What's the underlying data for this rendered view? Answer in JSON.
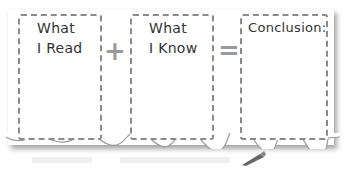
{
  "graphic": {
    "title": "Inference equation organizer",
    "boxes": [
      {
        "line1": "What",
        "line2": "I Read"
      },
      {
        "line1": "What",
        "line2": "I Know"
      },
      {
        "line1": "Conclusion:",
        "line2": ""
      }
    ],
    "operators": {
      "plus": "+",
      "equals": "="
    },
    "colors": {
      "border": "#8a8a8a",
      "text": "#333333",
      "operator": "#9a9a9a",
      "background": "#ffffff"
    }
  }
}
